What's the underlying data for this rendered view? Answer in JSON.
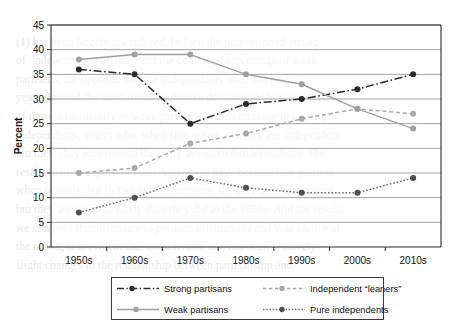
{
  "chart_data": {
    "type": "line",
    "title": "",
    "xlabel": "",
    "ylabel": "Percent",
    "categories": [
      "1950s",
      "1960s",
      "1970s",
      "1980s",
      "1990s",
      "2000s",
      "2010s"
    ],
    "ylim": [
      0,
      45
    ],
    "ytick_step": 5,
    "yticks": [
      "0",
      "5",
      "10",
      "15",
      "20",
      "25",
      "30",
      "35",
      "40",
      "45"
    ],
    "grid": "horizontal",
    "legend_position": "bottom",
    "series": [
      {
        "name": "Strong partisans",
        "values": [
          36,
          35,
          25,
          29,
          30,
          32,
          35
        ],
        "color": "#2b2b2b",
        "style": "dash-dot",
        "marker": "circle-filled"
      },
      {
        "name": "Independent “leaners”",
        "values": [
          15,
          16,
          21,
          23,
          26,
          28,
          27
        ],
        "color": "#a9a9a9",
        "style": "dashed",
        "marker": "circle-filled"
      },
      {
        "name": "Weak partisans",
        "values": [
          38,
          39,
          39,
          35,
          33,
          28,
          24
        ],
        "color": "#a0a0a0",
        "style": "solid",
        "marker": "circle-filled"
      },
      {
        "name": "Pure independents",
        "values": [
          7,
          10,
          14,
          12,
          11,
          11,
          14
        ],
        "color": "#6e6e6e",
        "style": "dotted",
        "marker": "circle-filled"
      }
    ]
  },
  "axes": {
    "y_label": "Percent"
  },
  "legend": {
    "items": [
      {
        "label": "Strong partisans"
      },
      {
        "label": "Independent “leaners”"
      },
      {
        "label": "Weak partisans"
      },
      {
        "label": "Pure independents"
      }
    ]
  },
  "background_text": {
    "lines": " \n(1) has been largely unexplored. In fact, the proportion of strong\nof  independent partisans, and the combined percentage of weak\npartisans, the opposite had the independents  over the past 60\nyears. Instead the main trend has been a decrease in the proportion\nof those who identify as weak partisans and an increase in leaning\nindependents, voters who, when first asked, say they are independent\nbut then, they turn toward the party as closeted independents. The\nresults are the impression that Americans have become less partisan\nwhen actually, but in fact more Americans say they are independent\nbut they are no more likely than they did in the 1950s. And the results\nwe compare the difference in partisan orientations and vote choice at\nthe outset, it is evident that considerable and has been relatively\nslight changes in the relationship between partisanship and   \n"
  }
}
